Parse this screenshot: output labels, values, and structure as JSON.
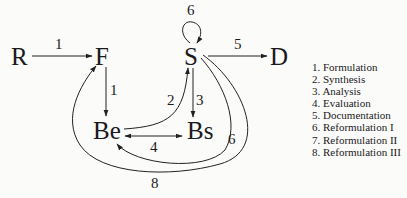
{
  "diagram": {
    "nodes": [
      {
        "id": "R",
        "label": "R"
      },
      {
        "id": "F",
        "label": "F"
      },
      {
        "id": "S",
        "label": "S"
      },
      {
        "id": "D",
        "label": "D"
      },
      {
        "id": "Be",
        "label": "Be"
      },
      {
        "id": "Bs",
        "label": "Bs"
      }
    ],
    "edges": [
      {
        "from": "R",
        "to": "F",
        "label": "1"
      },
      {
        "from": "F",
        "to": "Be",
        "label": "1"
      },
      {
        "from": "Be",
        "to": "S",
        "label": "2"
      },
      {
        "from": "S",
        "to": "Bs",
        "label": "3"
      },
      {
        "from": "Bs",
        "to": "Be",
        "label": "4",
        "bidirectional": true
      },
      {
        "from": "S",
        "to": "D",
        "label": "5"
      },
      {
        "from": "S",
        "to": "S",
        "label": "6"
      },
      {
        "from": "S",
        "to": "Be",
        "label": "7"
      },
      {
        "from": "S",
        "to": "F",
        "label": "8"
      }
    ],
    "legend": [
      "1. Formulation",
      "2. Synthesis",
      "3. Analysis",
      "4. Evaluation",
      "5. Documentation",
      "6. Reformulation I",
      "7. Reformulation II",
      "8. Reformulation III"
    ]
  }
}
